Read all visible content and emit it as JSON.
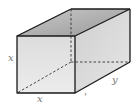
{
  "diagram": {
    "type": "rectangular-prism",
    "labels": {
      "front_height": "x",
      "front_width": "x",
      "depth": "y",
      "extra_mark": "'"
    },
    "colors": {
      "edge": "#1a1a1a",
      "front_face": "#e2e2e2",
      "top_face": "#a9a9a9",
      "side_face": "#d4d4d4",
      "label": "#777777"
    }
  }
}
